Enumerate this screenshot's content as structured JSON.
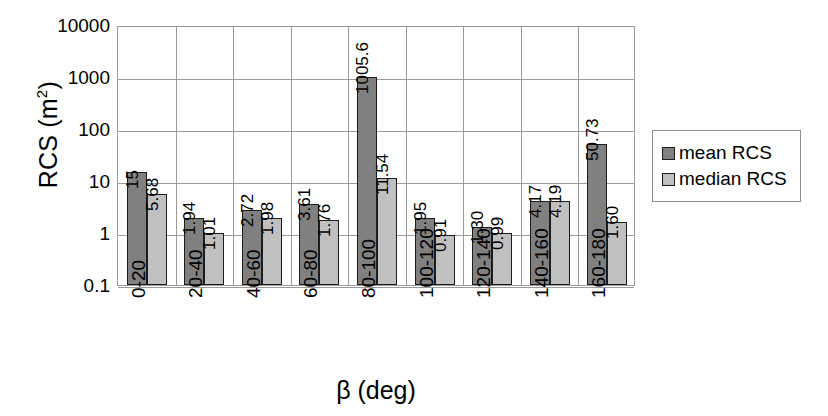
{
  "chart_data": {
    "type": "bar",
    "title": "",
    "xlabel": "β (deg)",
    "ylabel": "RCS (m",
    "ylabel_sup": "2",
    "ylabel_suffix": ")",
    "yscale": "log",
    "ylim": [
      0.1,
      10000
    ],
    "ytick_labels": [
      "10000",
      "1000",
      "100",
      "10",
      "1",
      "0.1"
    ],
    "ytick_values": [
      10000,
      1000,
      100,
      10,
      1,
      0.1
    ],
    "grid": true,
    "legend_position": "right",
    "categories": [
      "0-20",
      "20-40",
      "40-60",
      "60-80",
      "80-100",
      "100-120",
      "120-140",
      "140-160",
      "160-180"
    ],
    "series": [
      {
        "name": "mean RCS",
        "color": "#808080",
        "values": [
          15,
          1.94,
          2.72,
          3.61,
          1005.6,
          1.95,
          1.3,
          4.17,
          50.73
        ],
        "labels": [
          "15",
          "1.94",
          "2.72",
          "3.61",
          "1005.6",
          "1.95",
          "1.30",
          "4.17",
          "50.73"
        ]
      },
      {
        "name": "median RCS",
        "color": "#c0c0c0",
        "values": [
          5.68,
          1.01,
          1.98,
          1.76,
          11.54,
          0.91,
          0.99,
          4.19,
          1.6
        ],
        "labels": [
          "5.68",
          "1.01",
          "1.98",
          "1.76",
          "11.54",
          "0.91",
          "0.99",
          "4.19",
          "1.60"
        ]
      }
    ]
  },
  "legend": {
    "items": [
      {
        "label": "mean RCS",
        "swatch": "mean"
      },
      {
        "label": "median RCS",
        "swatch": "median"
      }
    ]
  }
}
